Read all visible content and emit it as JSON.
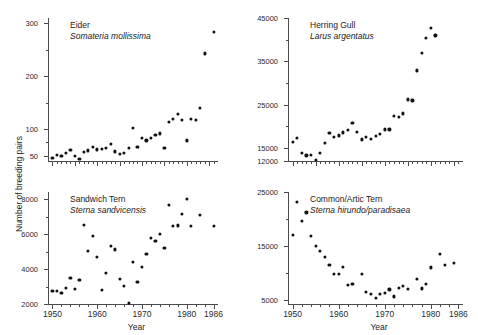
{
  "figure": {
    "ylabel": "Number of breeding pairs",
    "xlabel": "Year"
  },
  "chart_data": [
    {
      "type": "scatter",
      "panel": "top-left",
      "title": "Eider",
      "subtitle": "Somateria mollissima",
      "xlabel": "",
      "ylabel": "Number of breeding pairs",
      "xlim": [
        1949,
        1987
      ],
      "ylim": [
        40,
        310
      ],
      "yticks": [
        50,
        100,
        200,
        300
      ],
      "ytick_labels": [
        "50",
        "100",
        "200",
        "300"
      ],
      "xticks": [
        1950,
        1955,
        1960,
        1965,
        1970,
        1975,
        1980,
        1985
      ],
      "xtick_labels": [
        "",
        "",
        "",
        "",
        "",
        "",
        "",
        ""
      ],
      "grid": false,
      "x": [
        1950,
        1951,
        1952,
        1953,
        1954,
        1955,
        1956,
        1957,
        1958,
        1959,
        1960,
        1961,
        1962,
        1963,
        1964,
        1965,
        1966,
        1967,
        1968,
        1969,
        1970,
        1971,
        1972,
        1973,
        1974,
        1975,
        1976,
        1977,
        1978,
        1979,
        1980,
        1981,
        1982,
        1983,
        1984,
        1985,
        1986
      ],
      "y": [
        46,
        52,
        50,
        55,
        61,
        50,
        44,
        57,
        60,
        66,
        62,
        63,
        64,
        72,
        58,
        53,
        56,
        64,
        103,
        67,
        84,
        79,
        83,
        90,
        92,
        64,
        114,
        119,
        129,
        118,
        79,
        119,
        117,
        141,
        243,
        null,
        283
      ]
    },
    {
      "type": "scatter",
      "panel": "top-right",
      "title": "Herring Gull",
      "subtitle": "Larus argentatus",
      "xlabel": "",
      "ylabel": "Number of breeding pairs",
      "xlim": [
        1949,
        1987
      ],
      "ylim": [
        12000,
        45000
      ],
      "yticks": [
        12000,
        15000,
        25000,
        35000,
        45000
      ],
      "ytick_labels": [
        "12000",
        "15000",
        "25000",
        "35000",
        "45000"
      ],
      "xticks": [
        1950,
        1955,
        1960,
        1965,
        1970,
        1975,
        1980,
        1985
      ],
      "xtick_labels": [
        "",
        "",
        "",
        "",
        "",
        "",
        "",
        ""
      ],
      "grid": false,
      "x": [
        1950,
        1951,
        1952,
        1953,
        1954,
        1955,
        1956,
        1957,
        1958,
        1959,
        1960,
        1961,
        1962,
        1963,
        1964,
        1965,
        1966,
        1967,
        1968,
        1969,
        1970,
        1971,
        1972,
        1973,
        1974,
        1975,
        1976,
        1977,
        1978,
        1979,
        1980,
        1981,
        1982,
        1983,
        1984,
        1985,
        1986
      ],
      "y": [
        16400,
        17400,
        13900,
        13300,
        13500,
        12200,
        13900,
        16100,
        18500,
        17600,
        17900,
        18600,
        19200,
        20800,
        18700,
        17000,
        17600,
        17100,
        17800,
        18200,
        19300,
        19300,
        22500,
        22100,
        23000,
        26200,
        26000,
        32900,
        37000,
        40500,
        42700,
        41000,
        null,
        null,
        null,
        null,
        null
      ]
    },
    {
      "type": "scatter",
      "panel": "bottom-left",
      "title": "Sandwich Tern",
      "subtitle": "Sterna sandvicensis",
      "xlabel": "Year",
      "ylabel": "Number of breeding pairs",
      "xlim": [
        1949,
        1987
      ],
      "ylim": [
        2000,
        8400
      ],
      "yticks": [
        2000,
        4000,
        6000,
        8000
      ],
      "ytick_labels": [
        "2000",
        "4000",
        "6000",
        "8000"
      ],
      "xticks": [
        1950,
        1960,
        1970,
        1980,
        1986
      ],
      "xtick_labels": [
        "1950",
        "1960",
        "1970",
        "1980",
        "1986"
      ],
      "grid": false,
      "x": [
        1950,
        1951,
        1952,
        1953,
        1954,
        1955,
        1956,
        1957,
        1958,
        1959,
        1960,
        1961,
        1962,
        1963,
        1964,
        1965,
        1966,
        1967,
        1968,
        1969,
        1970,
        1971,
        1972,
        1973,
        1974,
        1975,
        1976,
        1977,
        1978,
        1979,
        1980,
        1981,
        1982,
        1983,
        1984,
        1985,
        1986
      ],
      "y": [
        2750,
        2760,
        2630,
        2900,
        3480,
        2850,
        3380,
        6540,
        5050,
        5900,
        4680,
        2820,
        3800,
        5320,
        5120,
        3450,
        3020,
        2050,
        4400,
        3240,
        4100,
        4880,
        5780,
        5620,
        5990,
        5220,
        7680,
        6480,
        6490,
        7140,
        8000,
        6460,
        null,
        7100,
        null,
        null,
        6460
      ]
    },
    {
      "type": "scatter",
      "panel": "bottom-right",
      "title": "Common/Artic Tern",
      "subtitle": "Sterna hirundo/paradisaea",
      "xlabel": "Year",
      "ylabel": "Number of breeding pairs",
      "xlim": [
        1949,
        1987
      ],
      "ylim": [
        4200,
        25000
      ],
      "yticks": [
        5000,
        15000,
        25000
      ],
      "ytick_labels": [
        "5000",
        "15000",
        "25000"
      ],
      "xticks": [
        1950,
        1960,
        1970,
        1980,
        1986
      ],
      "xtick_labels": [
        "1950",
        "1960",
        "1970",
        "1980",
        "1986"
      ],
      "grid": false,
      "x": [
        1950,
        1951,
        1952,
        1953,
        1954,
        1955,
        1956,
        1957,
        1958,
        1959,
        1960,
        1961,
        1962,
        1963,
        1964,
        1965,
        1966,
        1967,
        1968,
        1969,
        1970,
        1971,
        1972,
        1973,
        1974,
        1975,
        1976,
        1977,
        1978,
        1979,
        1980,
        1981,
        1982,
        1983,
        1984,
        1985,
        1986
      ],
      "y": [
        17000,
        23100,
        19700,
        21200,
        16800,
        15000,
        14100,
        13000,
        11500,
        9800,
        9800,
        11100,
        7800,
        8000,
        null,
        9800,
        6400,
        6100,
        5400,
        6000,
        6200,
        6900,
        5600,
        7200,
        7600,
        7000,
        null,
        8800,
        7100,
        8000,
        11000,
        null,
        13500,
        11500,
        null,
        11800,
        null
      ]
    }
  ]
}
